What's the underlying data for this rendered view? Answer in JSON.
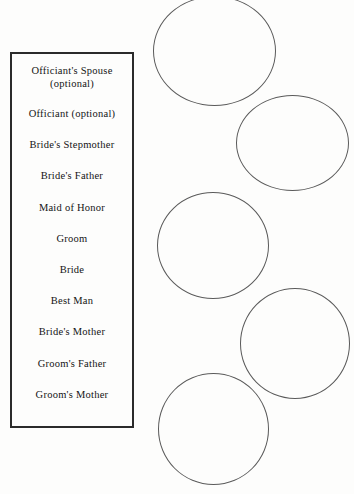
{
  "document": {
    "title": "Wedding Receiving Line Order Diagram",
    "background_color": "#fdfdfc"
  },
  "roster_box": {
    "border_color": "#2b2b2b",
    "text_color": "#141414",
    "rows": [
      {
        "label": "Officiant's Spouse",
        "sublabel": "(optional)"
      },
      {
        "label": "Officiant (optional)",
        "sublabel": ""
      },
      {
        "label": "Bride's Stepmother",
        "sublabel": ""
      },
      {
        "label": "Bride's Father",
        "sublabel": ""
      },
      {
        "label": "Maid of Honor",
        "sublabel": ""
      },
      {
        "label": "Groom",
        "sublabel": ""
      },
      {
        "label": "Bride",
        "sublabel": ""
      },
      {
        "label": "Best Man",
        "sublabel": ""
      },
      {
        "label": "Bride's Mother",
        "sublabel": ""
      },
      {
        "label": "Groom's Father",
        "sublabel": ""
      },
      {
        "label": "Groom's Mother",
        "sublabel": ""
      }
    ]
  },
  "circles": {
    "stroke_color": "#5a5a5a",
    "count": 5,
    "items": [
      {
        "name": "circle-1",
        "position": "left"
      },
      {
        "name": "circle-2",
        "position": "right"
      },
      {
        "name": "circle-3",
        "position": "left"
      },
      {
        "name": "circle-4",
        "position": "right"
      },
      {
        "name": "circle-5",
        "position": "left"
      }
    ]
  }
}
